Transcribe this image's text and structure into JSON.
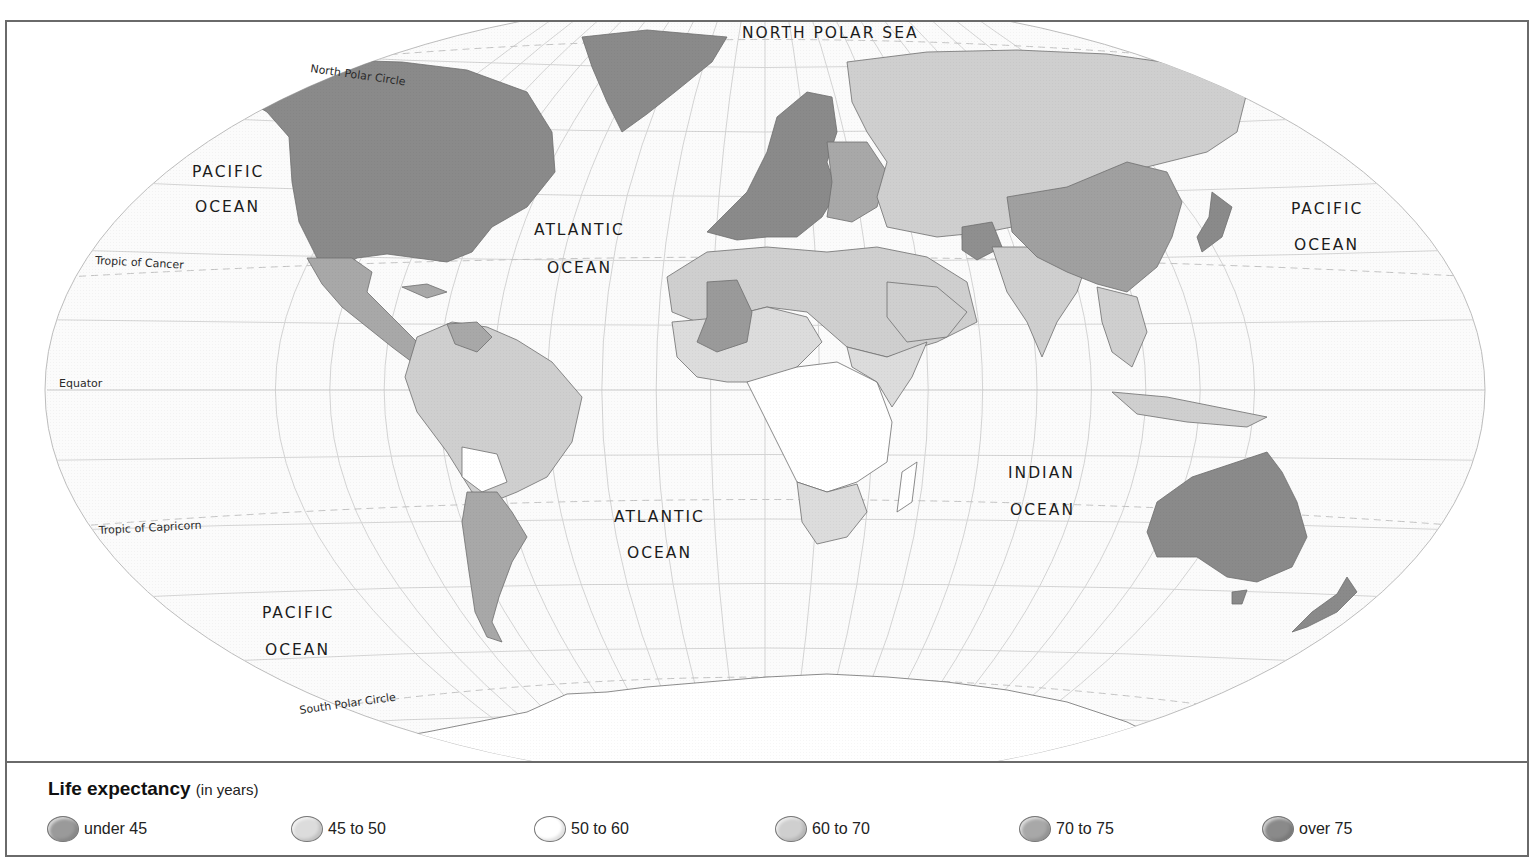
{
  "map": {
    "title": "World map: Life expectancy",
    "ocean_labels": [
      {
        "id": "north-polar-sea",
        "lines": [
          "NORTH POLAR SEA"
        ]
      },
      {
        "id": "pacific-ocean-northwest",
        "lines": [
          "PACIFIC",
          "OCEAN"
        ]
      },
      {
        "id": "atlantic-ocean-north",
        "lines": [
          "ATLANTIC",
          "OCEAN"
        ]
      },
      {
        "id": "pacific-ocean-east",
        "lines": [
          "PACIFIC",
          "OCEAN"
        ]
      },
      {
        "id": "atlantic-ocean-south",
        "lines": [
          "ATLANTIC",
          "OCEAN"
        ]
      },
      {
        "id": "indian-ocean",
        "lines": [
          "INDIAN",
          "OCEAN"
        ]
      },
      {
        "id": "pacific-ocean-south",
        "lines": [
          "PACIFIC",
          "OCEAN"
        ]
      }
    ],
    "line_labels": {
      "north_polar_circle": "North Polar Circle",
      "tropic_of_cancer": "Tropic of Cancer",
      "equator": "Equator",
      "tropic_of_capricorn": "Tropic of Capricorn",
      "south_polar_circle": "South Polar Circle"
    },
    "region_classes": {
      "north_america": "over 75",
      "greenland": "over 75",
      "mexico_central_america": "70 to 75",
      "venezuela": "70 to 75",
      "northern_south_america": "60 to 70",
      "brazil": "60 to 70",
      "bolivia": "50 to 60",
      "argentina_chile": "70 to 75",
      "western_europe": "over 75",
      "eastern_europe": "70 to 75",
      "russia_central_asia": "60 to 70",
      "north_africa_middle_east": "60 to 70",
      "sahel_west_africa": "45 to 50",
      "mali_region": "under 45",
      "central_southern_africa": "50 to 60",
      "east_africa": "45 to 50",
      "southern_africa": "45 to 50",
      "india": "60 to 70",
      "china": "70 to 75",
      "japan": "over 75",
      "southeast_asia": "60 to 70",
      "indonesia": "60 to 70",
      "australia": "over 75",
      "new_zealand": "over 75",
      "afghanistan": "under 45",
      "antarctica": "no data"
    }
  },
  "legend": {
    "title": "Life expectancy",
    "unit": "(in years)",
    "items": [
      {
        "label": "under 45",
        "color": "#9a9a9a"
      },
      {
        "label": "45 to 50",
        "color": "#dcdcdc"
      },
      {
        "label": "50 to 60",
        "color": "#ffffff"
      },
      {
        "label": "60 to 70",
        "color": "#cfcfcf"
      },
      {
        "label": "70 to 75",
        "color": "#a8a8a8"
      },
      {
        "label": "over 75",
        "color": "#8a8a8a"
      }
    ]
  },
  "colors": {
    "frame": "#6a6a6a",
    "graticule": "#cfcfcf",
    "ocean": "#fbfbfb",
    "coast": "#777777"
  }
}
